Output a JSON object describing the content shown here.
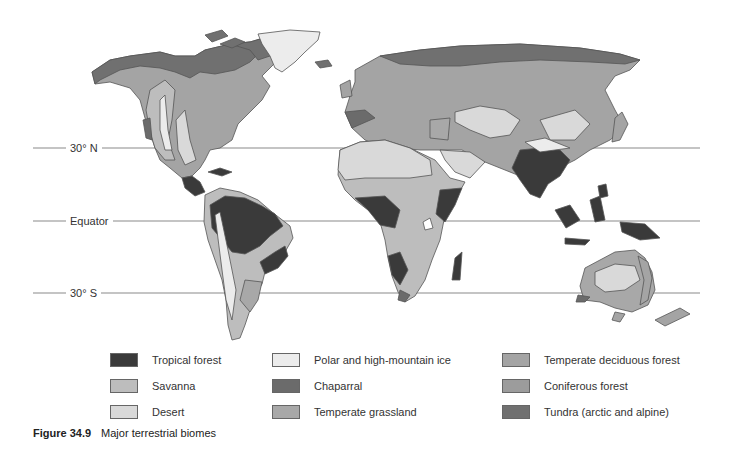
{
  "figure": {
    "number": "Figure 34.9",
    "title": "Major terrestrial biomes"
  },
  "latitude_lines": [
    {
      "label": "30° N",
      "y": 148
    },
    {
      "label": "Equator",
      "y": 221
    },
    {
      "label": "30° S",
      "y": 293
    }
  ],
  "legend": {
    "items": [
      {
        "label": "Tropical forest",
        "color": "#3a3a3a"
      },
      {
        "label": "Savanna",
        "color": "#bdbdbd"
      },
      {
        "label": "Desert",
        "color": "#d9d9d9"
      },
      {
        "label": "Polar and high-mountain ice",
        "color": "#ececec"
      },
      {
        "label": "Chaparral",
        "color": "#6b6b6b"
      },
      {
        "label": "Temperate grassland",
        "color": "#a8a8a8"
      },
      {
        "label": "Temperate deciduous forest",
        "color": "#a4a4a4"
      },
      {
        "label": "Coniferous forest",
        "color": "#9c9c9c"
      },
      {
        "label": "Tundra (arctic and alpine)",
        "color": "#707070"
      }
    ]
  }
}
